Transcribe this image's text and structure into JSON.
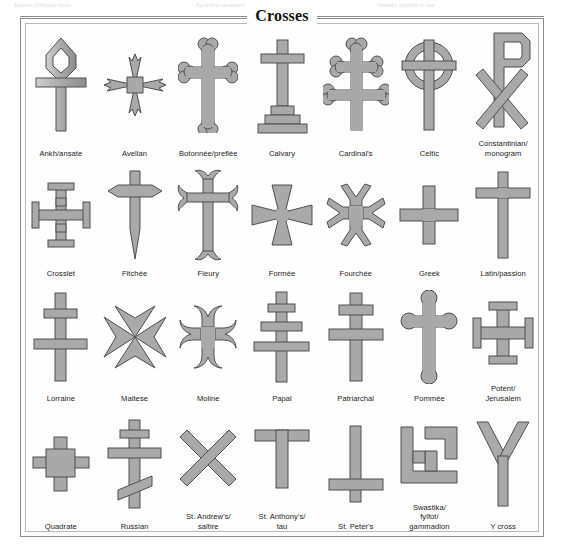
{
  "page": {
    "bleed_lines": [
      "Eastern Orthodox cross",
      "Byzantine variations",
      "heraldic symbols in use"
    ]
  },
  "figure": {
    "title": "Crosses",
    "border_color": "#8c8c8c",
    "fill_color": "#a8a8a8",
    "shade_color": "#8f8f8f",
    "highlight_color": "#d6d6d6"
  },
  "crosses": [
    {
      "id": "ankh",
      "label": "Ankh/ansate"
    },
    {
      "id": "avellan",
      "label": "Avellan"
    },
    {
      "id": "botonnee",
      "label": "Botonnée/preflée"
    },
    {
      "id": "calvary",
      "label": "Calvary"
    },
    {
      "id": "cardinals",
      "label": "Cardinal's"
    },
    {
      "id": "celtic",
      "label": "Celtic"
    },
    {
      "id": "constantinian",
      "label": "Constantinian/\nmonogram"
    },
    {
      "id": "crosslet",
      "label": "Crosslet"
    },
    {
      "id": "fitchee",
      "label": "Fitchée"
    },
    {
      "id": "fleury",
      "label": "Fleury"
    },
    {
      "id": "formee",
      "label": "Formée"
    },
    {
      "id": "fourchee",
      "label": "Fourchée"
    },
    {
      "id": "greek",
      "label": "Greek"
    },
    {
      "id": "latin",
      "label": "Latin/passion"
    },
    {
      "id": "lorraine",
      "label": "Lorraine"
    },
    {
      "id": "maltese",
      "label": "Maltese"
    },
    {
      "id": "moline",
      "label": "Moline"
    },
    {
      "id": "papal",
      "label": "Papal"
    },
    {
      "id": "patriarchal",
      "label": "Patriarchal"
    },
    {
      "id": "pommee",
      "label": "Pommée"
    },
    {
      "id": "potent",
      "label": "Potent/\nJerusalem"
    },
    {
      "id": "quadrate",
      "label": "Quadrate"
    },
    {
      "id": "russian",
      "label": "Russian"
    },
    {
      "id": "standrews",
      "label": "St. Andrew's/\nsaltire"
    },
    {
      "id": "stanthonys",
      "label": "St. Anthony's/\ntau"
    },
    {
      "id": "stpeters",
      "label": "St. Peter's"
    },
    {
      "id": "swastika",
      "label": "Swastika/\nfylfot/\ngammadion"
    },
    {
      "id": "ycross",
      "label": "Y cross"
    }
  ]
}
